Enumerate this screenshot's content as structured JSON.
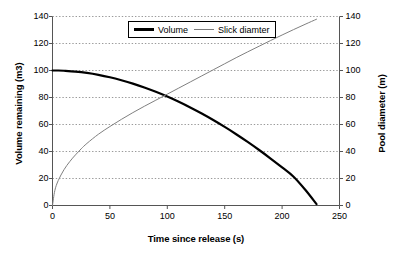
{
  "chart_data": {
    "type": "line",
    "title": "",
    "xlabel": "Time since release (s)",
    "ylabel": "Volume remaining (m3)",
    "y2label": "Pool diameter (m)",
    "xlim": [
      0,
      250
    ],
    "ylim": [
      0,
      140
    ],
    "y2lim": [
      0,
      140
    ],
    "xticks": [
      0,
      50,
      100,
      150,
      200,
      250
    ],
    "yticks": [
      0,
      20,
      40,
      60,
      80,
      100,
      120,
      140
    ],
    "y2ticks": [
      0,
      20,
      40,
      60,
      80,
      100,
      120,
      140
    ],
    "grid": "horizontal-dotted",
    "legend_position": "top-center",
    "series": [
      {
        "name": "Volume",
        "axis": "left",
        "color": "#000000",
        "width": 2.2,
        "x": [
          0,
          5,
          10,
          20,
          30,
          40,
          50,
          60,
          70,
          80,
          90,
          100,
          110,
          120,
          130,
          140,
          150,
          160,
          170,
          180,
          190,
          200,
          210,
          220,
          230
        ],
        "y": [
          100,
          100,
          99.8,
          99.2,
          98.2,
          96.8,
          95.0,
          92.8,
          90.3,
          87.4,
          84.2,
          80.7,
          76.8,
          72.6,
          68.1,
          63.3,
          58.2,
          52.8,
          47.1,
          41.1,
          34.8,
          28.2,
          21.3,
          11.8,
          1.0
        ]
      },
      {
        "name": "Slick diamter",
        "axis": "right",
        "color": "#808080",
        "width": 1.0,
        "x": [
          0,
          2,
          5,
          10,
          15,
          20,
          25,
          30,
          40,
          50,
          60,
          70,
          80,
          90,
          100,
          110,
          120,
          130,
          140,
          150,
          160,
          170,
          180,
          190,
          200,
          210,
          220,
          230
        ],
        "y": [
          0,
          11,
          18.5,
          26.5,
          32.5,
          37.5,
          42.0,
          46.0,
          52.8,
          58.5,
          63.8,
          68.8,
          73.5,
          78.0,
          82.5,
          87.0,
          91.5,
          96.0,
          100.5,
          105.0,
          109.5,
          113.8,
          118.0,
          122.2,
          126.3,
          130.3,
          134.2,
          138.0
        ]
      }
    ]
  },
  "legend": {
    "items": [
      {
        "label": "Volume"
      },
      {
        "label": "Slick diamter"
      }
    ]
  },
  "axes": {
    "x_title": "Time since release (s)",
    "y_left_title": "Volume remaining (m3)",
    "y_right_title": "Pool diameter (m)",
    "x_tick_labels": [
      "0",
      "50",
      "100",
      "150",
      "200",
      "250"
    ],
    "y_left_tick_labels": [
      "0",
      "20",
      "40",
      "60",
      "80",
      "100",
      "120",
      "140"
    ],
    "y_right_tick_labels": [
      "0",
      "20",
      "40",
      "60",
      "80",
      "100",
      "120",
      "140"
    ]
  },
  "colors": {
    "volume_line": "#000000",
    "slick_line": "#808080",
    "grid": "#9a9a9a",
    "axis": "#555555",
    "background": "#ffffff"
  }
}
